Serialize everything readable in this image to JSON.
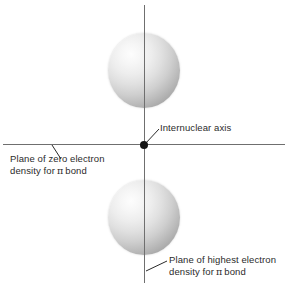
{
  "figure": {
    "background_color": "#ffffff",
    "axis_color": "#6f6f6f",
    "nucleus_color": "#151515",
    "label_color": "#2b2b2b",
    "lobe_highlight_color": "#fdfdfd",
    "lobe_shadow_color": "#9b9b9b"
  },
  "labels": {
    "internuclear_axis": "Internuclear axis",
    "zero_plane_line1": "Plane of zero electron",
    "zero_plane_line2_prefix": "density for",
    "zero_plane_line2_symbol": "π",
    "zero_plane_line2_suffix": "bond",
    "highest_plane_line1": "Plane of highest electron",
    "highest_plane_line2_prefix": "density for",
    "highest_plane_line2_symbol": "π",
    "highest_plane_line2_suffix": "bond"
  },
  "elements": {
    "top_lobe_name": "upper p-orbital lobe",
    "bottom_lobe_name": "lower p-orbital lobe",
    "nucleus_name": "nucleus point",
    "horizontal_axis_name": "internuclear axis line",
    "vertical_axis_name": "plane of highest electron density line"
  }
}
